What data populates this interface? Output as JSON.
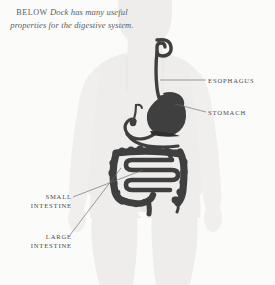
{
  "figure": {
    "background_color": "#fbfbfa",
    "body_fill_color": "#eeedeb",
    "body_shadow_color": "#e3e2df",
    "organ_color": "#3f3f3f",
    "leader_line_color": "#6b6b6b",
    "label_text_color": "#4a4a4a"
  },
  "caption": {
    "lead_in": "BELOW",
    "text": "Dock has many useful properties for the digestive system."
  },
  "labels": [
    {
      "id": "esophagus",
      "text": "ESOPHAGUS",
      "side": "right"
    },
    {
      "id": "stomach",
      "text": "STOMACH",
      "side": "right"
    },
    {
      "id": "small_intestine",
      "text": "SMALL\nINTESTINE",
      "side": "left"
    },
    {
      "id": "large_intestine",
      "text": "LARGE\nINTESTINE",
      "side": "left"
    }
  ],
  "illustration": {
    "subject": "human-body-silhouette",
    "organs": [
      "esophagus",
      "stomach",
      "duodenum",
      "gallbladder",
      "small-intestine",
      "large-intestine"
    ]
  }
}
